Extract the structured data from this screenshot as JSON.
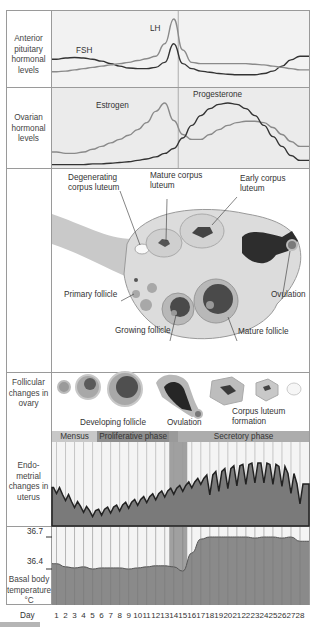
{
  "sections": {
    "pituitary": {
      "label": "Anterior pituitary hormonal levels",
      "curves": [
        "FSH",
        "LH"
      ]
    },
    "ovarian": {
      "label": "Ovarian hormonal levels",
      "curves": [
        "Estrogen",
        "Progesterone"
      ]
    },
    "ovary": {
      "labels": {
        "degenerating": "Degenerating corpus luteum",
        "mature_cl": "Mature corpus luteum",
        "early_cl": "Early corpus luteum",
        "primary": "Primary follicle",
        "growing": "Growing follicle",
        "mature_follicle": "Mature follicle",
        "ovulation": "Ovulation"
      }
    },
    "follicular": {
      "label": "Follicular changes in ovary",
      "labels": {
        "developing": "Developing follicle",
        "ovulation": "Ovulation",
        "corpus_luteum": "Corpus luteum formation"
      }
    },
    "phases": [
      {
        "name": "Mensus",
        "start_day": 1,
        "end_day": 5,
        "color": "#c8c8c8"
      },
      {
        "name": "Proliferative phase",
        "start_day": 6,
        "end_day": 13,
        "color": "#8e8e8e"
      },
      {
        "name": "Secretory phase",
        "start_day": 15,
        "end_day": 28,
        "color": "#acacac"
      }
    ],
    "endometrial": {
      "label": "Endo- metrial changes in uterus"
    },
    "basal": {
      "label": "Basal body temperature °C",
      "ticks": [
        "36.7",
        "36.4"
      ]
    },
    "day_label": "Day",
    "days": [
      "1",
      "2",
      "3",
      "4",
      "5",
      "6",
      "7",
      "8",
      "9",
      "10",
      "11",
      "12",
      "13",
      "14",
      "15",
      "16",
      "17",
      "18",
      "19",
      "20",
      "21",
      "22",
      "23",
      "24",
      "25",
      "26",
      "27",
      "28"
    ]
  },
  "chart_data": {
    "type": "line",
    "title": "",
    "x": [
      1,
      2,
      3,
      4,
      5,
      6,
      7,
      8,
      9,
      10,
      11,
      12,
      13,
      14,
      15,
      16,
      17,
      18,
      19,
      20,
      21,
      22,
      23,
      24,
      25,
      26,
      27,
      28
    ],
    "xlabel": "Day",
    "series": [
      {
        "name": "FSH",
        "values": [
          0.35,
          0.37,
          0.38,
          0.37,
          0.35,
          0.32,
          0.28,
          0.24,
          0.21,
          0.2,
          0.2,
          0.22,
          0.3,
          0.6,
          0.28,
          0.2,
          0.16,
          0.14,
          0.12,
          0.11,
          0.1,
          0.1,
          0.1,
          0.12,
          0.16,
          0.24,
          0.34,
          0.4
        ]
      },
      {
        "name": "LH",
        "values": [
          0.15,
          0.16,
          0.18,
          0.2,
          0.22,
          0.24,
          0.26,
          0.28,
          0.3,
          0.33,
          0.36,
          0.4,
          0.6,
          1.0,
          0.5,
          0.3,
          0.28,
          0.28,
          0.28,
          0.28,
          0.28,
          0.28,
          0.27,
          0.26,
          0.24,
          0.22,
          0.2,
          0.18
        ]
      },
      {
        "name": "Estrogen",
        "values": [
          0.2,
          0.18,
          0.18,
          0.2,
          0.24,
          0.28,
          0.33,
          0.38,
          0.44,
          0.52,
          0.62,
          0.78,
          0.9,
          0.65,
          0.45,
          0.38,
          0.38,
          0.45,
          0.52,
          0.58,
          0.62,
          0.64,
          0.64,
          0.62,
          0.55,
          0.45,
          0.35,
          0.28
        ]
      },
      {
        "name": "Progesterone",
        "values": [
          0.02,
          0.02,
          0.02,
          0.02,
          0.03,
          0.03,
          0.04,
          0.05,
          0.06,
          0.08,
          0.1,
          0.13,
          0.18,
          0.25,
          0.4,
          0.58,
          0.72,
          0.82,
          0.88,
          0.9,
          0.88,
          0.82,
          0.72,
          0.58,
          0.42,
          0.28,
          0.15,
          0.08
        ]
      },
      {
        "name": "Basal body temperature",
        "values": [
          36.45,
          36.42,
          36.41,
          36.42,
          36.4,
          36.41,
          36.41,
          36.41,
          36.4,
          36.41,
          36.42,
          36.43,
          36.43,
          36.42,
          36.38,
          36.55,
          36.68,
          36.7,
          36.7,
          36.7,
          36.7,
          36.7,
          36.69,
          36.7,
          36.7,
          36.69,
          36.7,
          36.66
        ]
      }
    ],
    "yticks_temperature": [
      36.4,
      36.7
    ],
    "ovulation_day": 14
  }
}
